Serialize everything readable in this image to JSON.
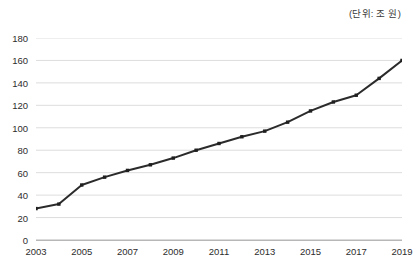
{
  "annotations": {
    "unit_label": "(단위: 조 원)"
  },
  "chart_data": {
    "type": "line",
    "title": "",
    "subtitle": "",
    "xlabel": "",
    "ylabel": "",
    "unit_note": "(단위: 조 원)",
    "grid": "horizontal",
    "legend": "none",
    "xlim": [
      2003,
      2019
    ],
    "ylim": [
      0,
      180
    ],
    "y_tick_step": 20,
    "y_ticks": [
      180,
      160,
      140,
      120,
      100,
      80,
      60,
      40,
      20,
      0
    ],
    "y_tick_labels": [
      "180",
      "160",
      "140",
      "120",
      "100",
      "80",
      "60",
      "40",
      "20",
      "0"
    ],
    "x_ticks": [
      2003,
      2005,
      2007,
      2009,
      2011,
      2013,
      2015,
      2017,
      2019
    ],
    "x_tick_labels": [
      "2003",
      "2005",
      "2007",
      "2009",
      "2011",
      "2013",
      "2015",
      "2017",
      "2019"
    ],
    "x": [
      2003,
      2004,
      2005,
      2006,
      2007,
      2008,
      2009,
      2010,
      2011,
      2012,
      2013,
      2014,
      2015,
      2016,
      2017,
      2018,
      2019
    ],
    "categories": [
      "2003",
      "2004",
      "2005",
      "2006",
      "2007",
      "2008",
      "2009",
      "2010",
      "2011",
      "2012",
      "2013",
      "2014",
      "2015",
      "2016",
      "2017",
      "2018",
      "2019"
    ],
    "values": [
      28,
      32,
      49,
      56,
      62,
      67,
      73,
      80,
      86,
      92,
      97,
      105,
      115,
      123,
      129,
      144,
      160
    ],
    "series": [
      {
        "name": "",
        "values": [
          28,
          32,
          49,
          56,
          62,
          67,
          73,
          80,
          86,
          92,
          97,
          105,
          115,
          123,
          129,
          144,
          160
        ]
      }
    ],
    "marker": "square",
    "line_color": "#2b2b2b",
    "marker_color": "#1f1f1f",
    "grid_color": "#d9d9d9",
    "axis_color": "#b7b7b7",
    "text_color": "#2d2d2d",
    "background": "#ffffff"
  }
}
